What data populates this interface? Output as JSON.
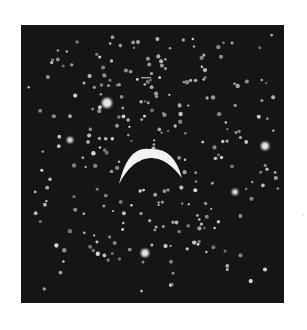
{
  "image": {
    "subject": "photographic plate of a bright crescent over a dense field of light spots",
    "background_color": "#ffffff",
    "plate_color": "#151515",
    "spot_color": "#bdbdbd",
    "crescent_color": "#f2f2f2"
  },
  "plate": {
    "x": 21,
    "y": 25,
    "width": 263,
    "height": 278
  },
  "crescent": {
    "center_x": 150,
    "top_y": 149,
    "left_tip": [
      119,
      184
    ],
    "right_tip": [
      182,
      178
    ]
  },
  "bright_spots": [
    {
      "x": 107,
      "y": 103,
      "r": 5
    },
    {
      "x": 265,
      "y": 146,
      "r": 4
    },
    {
      "x": 145,
      "y": 253,
      "r": 4
    },
    {
      "x": 70,
      "y": 140,
      "r": 3
    },
    {
      "x": 235,
      "y": 192,
      "r": 3
    }
  ],
  "spot_field": {
    "count": 420,
    "seed": 7,
    "min_r": 1.1,
    "max_r": 2.2
  },
  "dash": {
    "x": 141,
    "y": 77,
    "w": 10,
    "h": 1.5
  }
}
